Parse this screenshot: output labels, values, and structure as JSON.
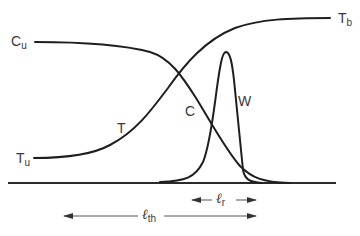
{
  "figure": {
    "labels": {
      "c_unburned": {
        "main": "C",
        "sub": "u"
      },
      "t_burned": {
        "main": "T",
        "sub": "b"
      },
      "t_unburned": {
        "main": "T",
        "sub": "u"
      },
      "temperature": "T",
      "concentration": "C",
      "reaction_rate": "W"
    },
    "dimensions": {
      "reaction_zone": {
        "symbol": "ℓ",
        "sub": "r"
      },
      "thermal_thickness": {
        "symbol": "ℓ",
        "sub": "th"
      }
    },
    "colors": {
      "ink": "#1e1e1e",
      "text": "#3a3a3a",
      "background": "#ffffff"
    }
  }
}
